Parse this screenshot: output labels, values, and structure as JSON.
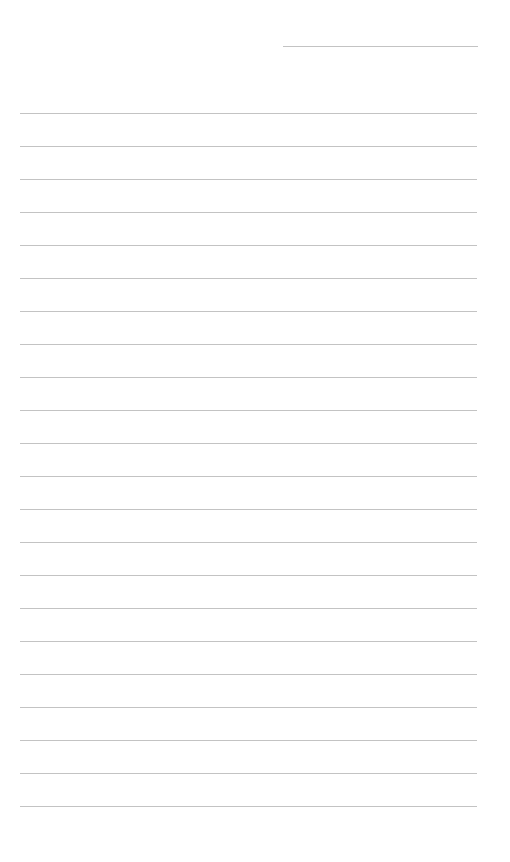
{
  "page": {
    "type": "lined-paper",
    "background": "#ffffff",
    "rule_color": "#b8b8b8",
    "header_line": {
      "left": 283,
      "width": 195,
      "top": 46
    },
    "lines": {
      "left": 20,
      "width": 457,
      "first_top": 113,
      "spacing": 33,
      "count": 22
    }
  }
}
